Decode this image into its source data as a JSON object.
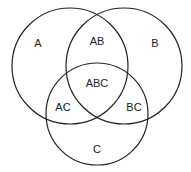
{
  "diagram": {
    "type": "venn",
    "sets": [
      {
        "name": "A",
        "cx": 70,
        "cy": 66,
        "r": 58
      },
      {
        "name": "B",
        "cx": 124,
        "cy": 66,
        "r": 58
      },
      {
        "name": "C",
        "cx": 97,
        "cy": 114,
        "r": 51
      }
    ],
    "regions": {
      "a": "A",
      "b": "B",
      "c": "C",
      "ab": "AB",
      "ac": "AC",
      "bc": "BC",
      "abc": "ABC"
    },
    "stroke_color": "#222222",
    "background": "#ffffff"
  }
}
